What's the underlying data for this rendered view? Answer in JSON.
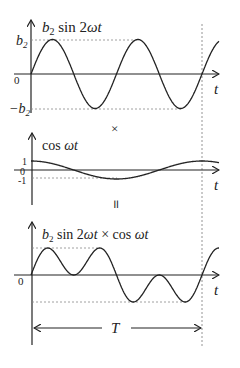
{
  "top": {
    "function_label_b": "b",
    "function_label_sub": "2",
    "function_label_rest": " sin 2",
    "function_label_omega_t": "ωt",
    "y_tick_pos_b": "b",
    "y_tick_pos_sub": "2",
    "y_tick_neg_b": "−b",
    "y_tick_neg_sub": "2",
    "origin": "0",
    "x_axis": "t"
  },
  "operator_times": "×",
  "middle": {
    "function_label": "cos ",
    "function_label_omega_t": "ωt",
    "y_tick_pos": "1",
    "origin": "0",
    "y_tick_neg": "-1",
    "x_axis": "t"
  },
  "operator_equals": "॥",
  "bottom": {
    "function_label_b": "b",
    "function_label_sub": "2",
    "function_label_rest": " sin 2",
    "function_label_omega_t": "ωt",
    "function_label_times": " × cos ",
    "function_label_omega_t2": "ωt",
    "origin": "0",
    "x_axis": "t",
    "period_label": "T"
  }
}
